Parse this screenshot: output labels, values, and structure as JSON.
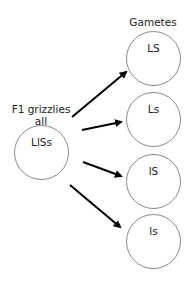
{
  "diagram": {
    "parent": {
      "label_line1": "F1 grizzlies",
      "label_line2": "all",
      "genotype": "LlSs"
    },
    "gametes_heading": "Gametes",
    "gametes": [
      {
        "label": "LS"
      },
      {
        "label": "Ls"
      },
      {
        "label": "lS"
      },
      {
        "label": "ls"
      }
    ],
    "colors": {
      "circle_stroke": "#8a8a8a",
      "arrow": "#000000",
      "text": "#222222"
    }
  }
}
